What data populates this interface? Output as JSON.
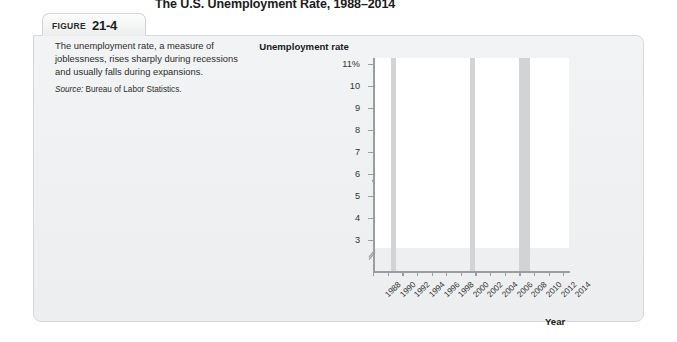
{
  "figure": {
    "tab_word": "FIGURE",
    "tab_number": "21-4",
    "title": "The U.S. Unemployment Rate, 1988–2014"
  },
  "caption": {
    "body": "The unemployment rate, a measure of joblessness, rises sharply during recessions and usually falls during expansions.",
    "source_label": "Source:",
    "source_text": "Bureau of Labor Statistics."
  },
  "colors": {
    "line": "#949698",
    "recession_band": "#d2d3d4",
    "axis": "#9b9ea1",
    "plot_background": "#ffffff",
    "card_background": "#f0f1f2"
  },
  "chart_data": {
    "type": "line",
    "title": "The U.S. Unemployment Rate, 1988–2014",
    "xlabel": "Year",
    "ylabel": "Unemployment rate",
    "xlim": [
      1988,
      2014.8
    ],
    "ylim": [
      2.6,
      11.4
    ],
    "y_axis_break": true,
    "y_axis_break_note": "axis broken between 0 and 3",
    "grid": false,
    "legend": null,
    "ytick_labels": [
      "11%",
      "10",
      "9",
      "8",
      "7",
      "6",
      "5",
      "4",
      "3"
    ],
    "yticks": [
      11,
      10,
      9,
      8,
      7,
      6,
      5,
      4,
      3
    ],
    "xtick_labels": [
      "1988",
      "1990",
      "1992",
      "1994",
      "1996",
      "1998",
      "2000",
      "2002",
      "2004",
      "2006",
      "2008",
      "2010",
      "2012",
      "2014"
    ],
    "xticks": [
      1988,
      1990,
      1992,
      1994,
      1996,
      1998,
      2000,
      2002,
      2004,
      2006,
      2008,
      2010,
      2012,
      2014
    ],
    "series": [
      {
        "name": "Unemployment rate",
        "x": [
          1988.0,
          1988.3,
          1988.6,
          1988.9,
          1989.2,
          1989.5,
          1989.8,
          1990.1,
          1990.4,
          1990.7,
          1991.0,
          1991.3,
          1991.6,
          1991.9,
          1992.2,
          1992.5,
          1992.8,
          1993.1,
          1993.4,
          1993.7,
          1994.0,
          1994.4,
          1994.8,
          1995.2,
          1995.6,
          1996.0,
          1996.4,
          1996.8,
          1997.2,
          1997.6,
          1998.0,
          1998.4,
          1998.8,
          1999.2,
          1999.6,
          2000.0,
          2000.4,
          2000.8,
          2001.0,
          2001.3,
          2001.6,
          2001.9,
          2002.2,
          2002.5,
          2002.8,
          2003.1,
          2003.4,
          2003.7,
          2004.0,
          2004.5,
          2005.0,
          2005.5,
          2006.0,
          2006.5,
          2007.0,
          2007.4,
          2007.8,
          2008.1,
          2008.4,
          2008.7,
          2009.0,
          2009.2,
          2009.4,
          2009.7,
          2009.9,
          2010.1,
          2010.4,
          2010.7,
          2011.0,
          2011.4,
          2011.8,
          2012.2,
          2012.6,
          2013.0,
          2013.4,
          2013.8,
          2014.2,
          2014.5
        ],
        "y": [
          5.7,
          5.5,
          5.4,
          5.3,
          5.2,
          5.0,
          5.2,
          5.3,
          5.3,
          5.4,
          5.6,
          5.7,
          6.2,
          6.8,
          7.2,
          7.5,
          7.8,
          7.6,
          7.4,
          7.1,
          6.9,
          6.6,
          6.3,
          6.1,
          5.7,
          5.6,
          5.5,
          5.4,
          5.3,
          5.0,
          4.9,
          4.7,
          4.6,
          4.5,
          4.3,
          4.2,
          4.0,
          3.9,
          4.0,
          4.2,
          4.5,
          4.8,
          5.4,
          5.7,
          5.8,
          5.9,
          6.1,
          6.3,
          6.1,
          5.8,
          5.6,
          5.3,
          5.1,
          4.8,
          4.6,
          4.5,
          4.4,
          4.6,
          5.0,
          5.6,
          6.4,
          7.6,
          8.4,
          9.2,
          9.8,
          10.1,
          9.9,
          10.0,
          9.7,
          9.4,
          9.1,
          8.8,
          8.4,
          8.1,
          7.7,
          7.3,
          6.9,
          6.5
        ]
      }
    ],
    "recession_bands": [
      {
        "label": "1990–1991 recession",
        "start": 1990.5,
        "end": 1991.2
      },
      {
        "label": "2001 recession",
        "start": 2001.2,
        "end": 2001.9
      },
      {
        "label": "2007–2009 recession",
        "start": 2007.9,
        "end": 2009.5
      }
    ],
    "annotations": []
  }
}
